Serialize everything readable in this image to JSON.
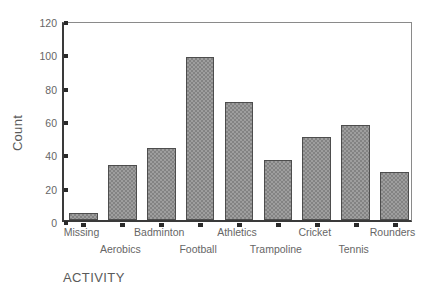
{
  "chart_data": {
    "type": "bar",
    "title": "",
    "xlabel": "ACTIVITY",
    "ylabel": "Count",
    "categories": [
      "Missing",
      "Aerobics",
      "Badminton",
      "Football",
      "Athletics",
      "Trampoline",
      "Cricket",
      "Tennis",
      "Rounders"
    ],
    "values": [
      4,
      33,
      43,
      98,
      71,
      36,
      50,
      57,
      29
    ],
    "ylim": [
      0,
      120
    ],
    "yticks": [
      0,
      20,
      40,
      60,
      80,
      100,
      120
    ],
    "ytick_labels": [
      "0",
      "20",
      "40",
      "60",
      "80",
      "100",
      "120"
    ],
    "grid": false,
    "legend": false,
    "bar_color": "#838383",
    "bar_edge_color": "#4d4d4d",
    "axis_color": "#3a3a3a",
    "background": "#ffffff",
    "label_rows": [
      "top",
      "bottom",
      "top",
      "bottom",
      "top",
      "bottom",
      "top",
      "bottom",
      "top"
    ]
  }
}
